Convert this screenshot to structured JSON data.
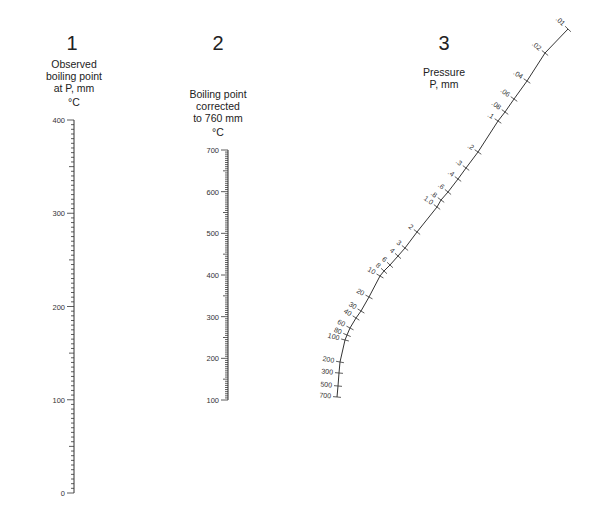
{
  "scales": [
    {
      "number": "1",
      "title_lines": [
        "Observed",
        "boiling point",
        "at P, mm"
      ],
      "unit": "°C",
      "min": 0,
      "max": 400,
      "major_step": 100,
      "minor_step": 5,
      "labels": [
        "0",
        "100",
        "200",
        "300",
        "400"
      ]
    },
    {
      "number": "2",
      "title_lines": [
        "Boiling point",
        "corrected",
        "to 760 mm"
      ],
      "unit": "°C",
      "min": 100,
      "max": 700,
      "major_step": 100,
      "minor_step": 5,
      "labels": [
        "100",
        "200",
        "300",
        "400",
        "500",
        "600",
        "700"
      ]
    },
    {
      "number": "3",
      "title_lines": [
        "Pressure",
        "P, mm"
      ],
      "unit": "mm",
      "labels": [
        ".01",
        ".02",
        ".04",
        ".06",
        ".08",
        ".1",
        ".2",
        ".3",
        ".4",
        ".6",
        ".8",
        "1.0",
        "2",
        "3",
        "4",
        "6",
        "8",
        "10",
        "20",
        "30",
        "40",
        "60",
        "80",
        "100",
        "200",
        "300",
        "500",
        "700"
      ]
    }
  ],
  "chart_data": {
    "type": "nomograph",
    "axes": [
      {
        "name": "Observed boiling point at P, mm (°C)",
        "range": [
          0,
          400
        ],
        "ticks": [
          0,
          100,
          200,
          300,
          400
        ]
      },
      {
        "name": "Boiling point corrected to 760 mm (°C)",
        "range": [
          100,
          700
        ],
        "ticks": [
          100,
          200,
          300,
          400,
          500,
          600,
          700
        ]
      },
      {
        "name": "Pressure P, mm",
        "scale": "log",
        "range": [
          0.01,
          700
        ],
        "ticks": [
          0.01,
          0.02,
          0.04,
          0.06,
          0.08,
          0.1,
          0.2,
          0.3,
          0.4,
          0.6,
          0.8,
          1.0,
          2,
          3,
          4,
          6,
          8,
          10,
          20,
          30,
          40,
          60,
          80,
          100,
          200,
          300,
          500,
          700
        ]
      }
    ]
  }
}
